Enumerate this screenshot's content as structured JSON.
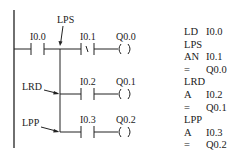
{
  "diagram": {
    "type": "ladder-logic",
    "annotations": {
      "lps": "LPS",
      "lrd": "LRD",
      "lpp": "LPP"
    },
    "rungs": [
      {
        "contact_label": "I0.0",
        "contact_type": "NO"
      },
      {
        "contact_label": "I0.1",
        "contact_type": "NC",
        "nc_symbol": "/",
        "coil_label": "Q0.0",
        "coil_symbol": "(   )"
      },
      {
        "contact_label": "I0.2",
        "contact_type": "NO",
        "coil_label": "Q0.1",
        "coil_symbol": "(   )"
      },
      {
        "contact_label": "I0.3",
        "contact_type": "NO",
        "coil_label": "Q0.2",
        "coil_symbol": "(   )"
      }
    ]
  },
  "instruction_list": [
    {
      "op": "LD",
      "arg": "I0.0"
    },
    {
      "op": "LPS",
      "arg": ""
    },
    {
      "op": "AN",
      "arg": "I0.1"
    },
    {
      "op": "=",
      "arg": "Q0.0"
    },
    {
      "op": "LRD",
      "arg": ""
    },
    {
      "op": "A",
      "arg": "I0.2"
    },
    {
      "op": "=",
      "arg": "Q0.1"
    },
    {
      "op": "LPP",
      "arg": ""
    },
    {
      "op": "A",
      "arg": "I0.3"
    },
    {
      "op": "=",
      "arg": "Q0.2"
    }
  ]
}
